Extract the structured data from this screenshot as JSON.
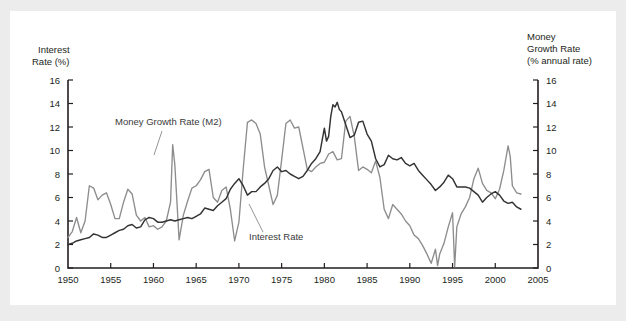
{
  "figure": {
    "background": "#ececec",
    "panel_background": "#ffffff"
  },
  "chart_data": {
    "type": "line",
    "title": "",
    "xlabel": "",
    "ylabel": "Interest Rate (%)",
    "y2label": "Money Growth Rate (% annual rate)",
    "grid": false,
    "legend_position": "inline-annotations",
    "xlim": [
      1950,
      2005
    ],
    "ylim": [
      0,
      16
    ],
    "y2lim": [
      0,
      16
    ],
    "xticks": [
      1950,
      1955,
      1960,
      1965,
      1970,
      1975,
      1980,
      1985,
      1990,
      1995,
      2000,
      2005
    ],
    "xticklabels": [
      "1950",
      "1955",
      "1960",
      "1965",
      "1970",
      "1975",
      "1980",
      "1985",
      "1990",
      "1995",
      "2000",
      "2005"
    ],
    "yticks": [
      0,
      2,
      4,
      6,
      8,
      10,
      12,
      14,
      16
    ],
    "yticklabels": [
      "0",
      "2",
      "4",
      "6",
      "8",
      "10",
      "12",
      "14",
      "16"
    ],
    "y2ticks": [
      0,
      2,
      4,
      6,
      8,
      10,
      12,
      14,
      16
    ],
    "y2ticklabels": [
      "0",
      "2",
      "4",
      "6",
      "8",
      "10",
      "12",
      "14",
      "16"
    ],
    "series": [
      {
        "name": "Interest Rate",
        "color": "#333333",
        "axis": "left",
        "annotation": "Interest Rate",
        "x": [
          1950.0,
          1950.5,
          1951.0,
          1951.5,
          1952.0,
          1952.5,
          1953.0,
          1953.5,
          1954.0,
          1954.5,
          1955.0,
          1955.5,
          1956.0,
          1956.5,
          1957.0,
          1957.5,
          1958.0,
          1958.5,
          1959.0,
          1959.5,
          1960.0,
          1960.5,
          1961.0,
          1961.5,
          1962.0,
          1962.5,
          1963.0,
          1963.5,
          1964.0,
          1964.5,
          1965.0,
          1965.5,
          1966.0,
          1966.5,
          1967.0,
          1967.5,
          1968.0,
          1968.5,
          1969.0,
          1969.5,
          1970.0,
          1970.5,
          1971.0,
          1971.5,
          1972.0,
          1972.5,
          1973.0,
          1973.5,
          1974.0,
          1974.5,
          1975.0,
          1975.5,
          1976.0,
          1976.5,
          1977.0,
          1977.5,
          1978.0,
          1978.5,
          1979.0,
          1979.5,
          1980.0,
          1980.25,
          1980.5,
          1980.75,
          1981.0,
          1981.25,
          1981.5,
          1981.75,
          1982.0,
          1982.5,
          1983.0,
          1983.5,
          1984.0,
          1984.5,
          1985.0,
          1985.5,
          1986.0,
          1986.5,
          1987.0,
          1987.5,
          1988.0,
          1988.5,
          1989.0,
          1989.5,
          1990.0,
          1990.5,
          1991.0,
          1991.5,
          1992.0,
          1992.5,
          1993.0,
          1993.5,
          1994.0,
          1994.5,
          1995.0,
          1995.5,
          1996.0,
          1996.5,
          1997.0,
          1997.5,
          1998.0,
          1998.5,
          1999.0,
          1999.5,
          2000.0,
          2000.5,
          2001.0,
          2001.5,
          2002.0,
          2002.5,
          2003.0
        ],
        "y": [
          2.0,
          2.1,
          2.3,
          2.4,
          2.5,
          2.6,
          2.9,
          2.8,
          2.6,
          2.6,
          2.8,
          3.0,
          3.2,
          3.3,
          3.6,
          3.7,
          3.4,
          3.5,
          4.1,
          4.3,
          4.2,
          3.9,
          3.9,
          4.0,
          4.1,
          4.0,
          4.1,
          4.2,
          4.3,
          4.2,
          4.4,
          4.6,
          5.1,
          5.0,
          4.9,
          5.3,
          5.6,
          5.9,
          6.7,
          7.2,
          7.6,
          7.0,
          6.2,
          6.5,
          6.5,
          6.9,
          7.2,
          7.6,
          8.3,
          8.6,
          8.2,
          8.3,
          8.0,
          7.8,
          7.6,
          7.8,
          8.3,
          8.9,
          9.3,
          9.9,
          11.9,
          10.8,
          11.2,
          12.9,
          13.9,
          13.7,
          14.1,
          13.5,
          13.3,
          12.2,
          11.1,
          11.3,
          12.4,
          12.5,
          11.4,
          10.8,
          9.3,
          8.6,
          8.8,
          9.6,
          9.3,
          9.2,
          9.4,
          8.9,
          8.7,
          8.9,
          8.3,
          7.9,
          7.5,
          7.1,
          6.6,
          6.9,
          7.3,
          7.9,
          7.6,
          6.9,
          6.9,
          6.9,
          6.8,
          6.5,
          6.2,
          5.6,
          6.0,
          6.3,
          6.5,
          6.2,
          5.7,
          5.5,
          5.6,
          5.2,
          5.0
        ]
      },
      {
        "name": "Money Growth Rate (M2)",
        "color": "#8d8d8d",
        "axis": "right",
        "annotation": "Money Growth Rate (M2)",
        "x": [
          1950.0,
          1950.5,
          1951.0,
          1951.5,
          1952.0,
          1952.5,
          1953.0,
          1953.5,
          1954.0,
          1954.5,
          1955.0,
          1955.5,
          1956.0,
          1956.5,
          1957.0,
          1957.5,
          1958.0,
          1958.5,
          1959.0,
          1959.5,
          1960.0,
          1960.5,
          1961.0,
          1961.5,
          1962.0,
          1962.25,
          1962.5,
          1963.0,
          1963.5,
          1964.0,
          1964.5,
          1965.0,
          1965.5,
          1966.0,
          1966.5,
          1967.0,
          1967.5,
          1968.0,
          1968.5,
          1969.0,
          1969.5,
          1970.0,
          1970.5,
          1971.0,
          1971.5,
          1972.0,
          1972.5,
          1973.0,
          1973.5,
          1974.0,
          1974.5,
          1975.0,
          1975.5,
          1976.0,
          1976.5,
          1977.0,
          1977.5,
          1978.0,
          1978.5,
          1979.0,
          1979.5,
          1980.0,
          1980.5,
          1981.0,
          1981.5,
          1982.0,
          1982.5,
          1983.0,
          1983.5,
          1984.0,
          1984.5,
          1985.0,
          1985.5,
          1986.0,
          1986.5,
          1987.0,
          1987.5,
          1988.0,
          1988.5,
          1989.0,
          1989.5,
          1990.0,
          1990.5,
          1991.0,
          1991.5,
          1992.0,
          1992.5,
          1993.0,
          1993.25,
          1993.5,
          1994.0,
          1994.5,
          1995.0,
          1995.25,
          1995.5,
          1996.0,
          1996.5,
          1997.0,
          1997.5,
          1998.0,
          1998.5,
          1999.0,
          1999.5,
          2000.0,
          2000.5,
          2001.0,
          2001.5,
          2001.75,
          2002.0,
          2002.5,
          2003.0
        ],
        "y": [
          2.6,
          3.1,
          4.3,
          3.0,
          4.0,
          7.0,
          6.8,
          5.8,
          6.2,
          6.4,
          5.4,
          4.2,
          4.2,
          5.6,
          6.7,
          6.3,
          4.5,
          4.0,
          4.3,
          3.5,
          3.6,
          3.3,
          3.5,
          4.0,
          5.6,
          10.5,
          8.8,
          2.4,
          4.5,
          5.7,
          6.8,
          7.0,
          7.5,
          8.2,
          8.4,
          6.0,
          5.6,
          6.6,
          6.9,
          5.0,
          2.3,
          3.9,
          8.4,
          12.4,
          12.6,
          12.3,
          11.4,
          8.6,
          7.0,
          5.4,
          6.2,
          9.2,
          12.3,
          12.6,
          11.9,
          12.0,
          10.2,
          8.4,
          8.2,
          8.6,
          8.9,
          9.0,
          9.7,
          9.9,
          9.2,
          9.3,
          12.5,
          12.9,
          11.2,
          8.3,
          8.6,
          8.4,
          8.1,
          9.1,
          7.7,
          5.0,
          4.2,
          5.4,
          5.0,
          4.6,
          4.0,
          3.6,
          2.8,
          2.5,
          1.9,
          1.2,
          0.4,
          1.6,
          0.2,
          1.2,
          2.1,
          3.5,
          4.7,
          0.1,
          3.5,
          4.6,
          5.2,
          6.0,
          7.6,
          8.5,
          7.2,
          6.6,
          6.4,
          5.9,
          6.7,
          8.3,
          10.4,
          9.5,
          7.0,
          6.4,
          6.3
        ]
      }
    ],
    "annotations": [
      {
        "text": "Money Growth Rate (M2)",
        "name": "money-growth-annotation"
      },
      {
        "text": "Interest Rate",
        "name": "interest-rate-annotation"
      }
    ]
  },
  "labels": {
    "left_axis_line1": "Interest",
    "left_axis_line2": "Rate (%)",
    "right_axis_line1": "Money",
    "right_axis_line2": "Growth Rate",
    "right_axis_line3": "(% annual rate)"
  }
}
